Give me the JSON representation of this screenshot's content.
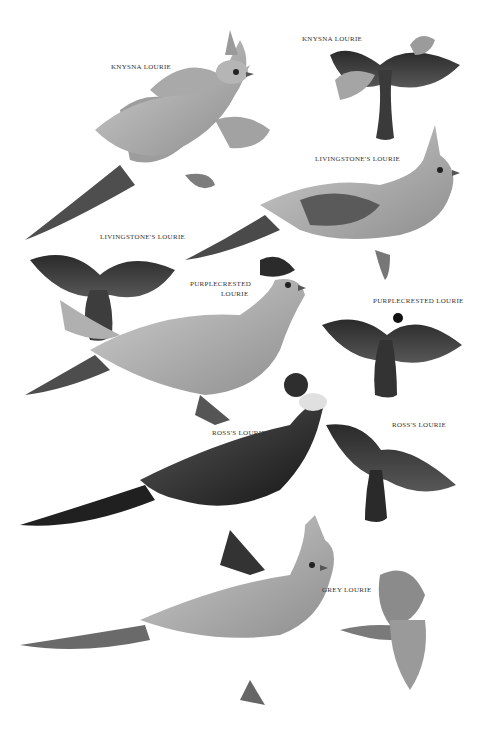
{
  "plate": {
    "background": "#ffffff",
    "labels": [
      {
        "id": "knysna-perched",
        "text": "KNYSNA LOURIE",
        "x": 111,
        "y": 63
      },
      {
        "id": "knysna-flight",
        "text": "KNYSNA LOURIE",
        "x": 302,
        "y": 35
      },
      {
        "id": "livingstone-perched",
        "text": "LIVINGSTONE'S LOURIE",
        "x": 315,
        "y": 155
      },
      {
        "id": "livingstone-flight",
        "text": "LIVINGSTONE'S LOURIE",
        "x": 100,
        "y": 233
      },
      {
        "id": "purplecrested-perched-1",
        "text": "PURPLECRESTED",
        "x": 190,
        "y": 280
      },
      {
        "id": "purplecrested-perched-2",
        "text": "LOURIE",
        "x": 221,
        "y": 290
      },
      {
        "id": "purplecrested-flight",
        "text": "PURPLECRESTED LOURIE",
        "x": 373,
        "y": 297
      },
      {
        "id": "ross-perched",
        "text": "ROSS'S LOURIE",
        "x": 212,
        "y": 429
      },
      {
        "id": "ross-flight",
        "text": "ROSS'S LOURIE",
        "x": 392,
        "y": 421
      },
      {
        "id": "grey-perched",
        "text": "GREY LOURIE",
        "x": 322,
        "y": 586
      }
    ],
    "colors": {
      "light": "#bdbdbd",
      "mid": "#8a8a8a",
      "dark": "#4a4a4a",
      "black": "#1c1c1c",
      "foliage": "#9c9c9c"
    }
  }
}
